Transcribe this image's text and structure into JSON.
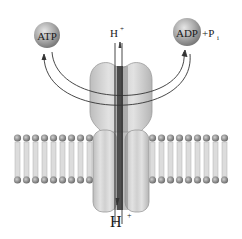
{
  "diagram": {
    "molecules": {
      "atp": {
        "label": "ATP"
      },
      "adp": {
        "label": "ADP"
      },
      "pi": {
        "label": "+P",
        "subscript": "i"
      }
    },
    "proton_top": {
      "label": "H",
      "superscript": "+"
    },
    "proton_bottom": {
      "label": "H",
      "superscript": "+"
    },
    "colors": {
      "sphere": "#9a9a9a",
      "protein": "#c8c8c8",
      "channel": "#3a3a3a",
      "membrane_head": "#8c8c8c",
      "membrane_tail": "#d6d6d6",
      "arrow": "#333333"
    }
  }
}
